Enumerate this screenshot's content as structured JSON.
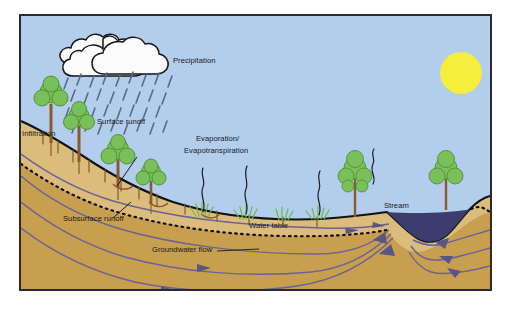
{
  "figure": {
    "border_color": "#2b2b2b",
    "page_background": "#ffffff"
  },
  "palette": {
    "sky": "#b3cded",
    "sun": "#f5ee3c",
    "cloud_fill": "#fbfbfb",
    "cloud_outline": "#15151a",
    "raindrop": "#5a6a86",
    "soil_unsaturated": "#d9b877",
    "soil_saturated": "#c89f4f",
    "ground_outline": "#111114",
    "water_table_line": "#101014",
    "stream_water": "#3c3c6e",
    "flow_line": "#6b6296",
    "arrow": "#5b5584",
    "tree_canopy": "#79c05a",
    "tree_canopy_dark": "#58a83f",
    "tree_trunk": "#8a5a2b",
    "grass": "#6fb94e",
    "vapor_line": "#1b1b20",
    "label_text": "#17171b"
  },
  "labels": {
    "precipitation": "Precipitation",
    "infiltration": "Infiltration",
    "surface_runoff": "Surface runoff",
    "subsurface_runoff": "Subsurface runoff",
    "evaporation_line1": "Evaporation/",
    "evaporation_line2": "Evapotranspiration",
    "water_table": "Water table",
    "groundwater_flow": "Groundwater flow",
    "stream": "Stream"
  },
  "elements": {
    "sun": {
      "cx": 440,
      "cy": 57,
      "r": 21
    },
    "cloud_cluster": "white cumulus cloud cluster, upper left",
    "rain_drop_count": 34,
    "trees_count": 7,
    "grass_tufts_count": 4,
    "vapor_squiggles_count": 4,
    "groundwater_flow_lines": 5,
    "flow_arrow_count": 11
  }
}
